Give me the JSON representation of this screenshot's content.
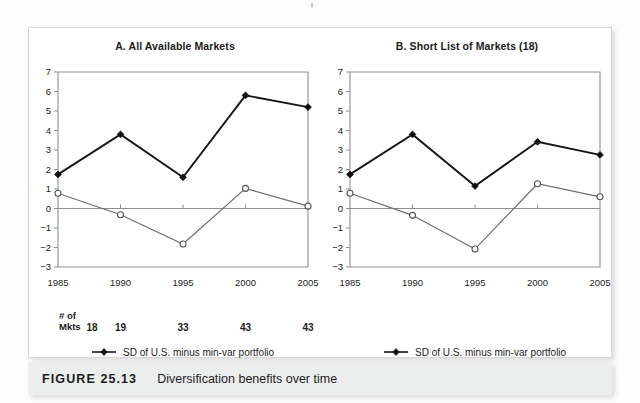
{
  "figure": {
    "caption_label": "FIGURE 25.13",
    "caption_text": "Diversification benefits over time"
  },
  "panels": [
    {
      "id": "A",
      "title": "A. All Available Markets",
      "mkts_head_line1": "# of",
      "mkts_head_line2": "Mkts",
      "mkts_values": [
        "18",
        "19",
        "33",
        "43",
        "43"
      ],
      "legend": [
        {
          "symbol": "filled-diamond-line",
          "label": "SD of U.S. minus min-var portfolio"
        },
        {
          "symbol": "open-circle-line",
          "label": "SD of U.S. minus mkt-cap portfolio"
        }
      ]
    },
    {
      "id": "B",
      "title": "B. Short List of Markets (18)",
      "legend": [
        {
          "symbol": "filled-diamond-line",
          "label": "SD of U.S. minus min-var portfolio"
        },
        {
          "symbol": "open-circle-line",
          "label": "SD of U.S. minus mkt-cap portfolio"
        }
      ]
    }
  ],
  "chart_data": [
    {
      "type": "line",
      "title": "A. All Available Markets",
      "xlabel": "",
      "ylabel": "",
      "x": [
        1985,
        1990,
        1995,
        2000,
        2005
      ],
      "xticklabels": [
        "1985",
        "1990",
        "1995",
        "2000",
        "2005"
      ],
      "yticks": [
        -3,
        -2,
        -1,
        0,
        1,
        2,
        3,
        4,
        5,
        6,
        7
      ],
      "yticklabels": [
        "−3",
        "−2",
        "−1",
        "0",
        "1",
        "2",
        "3",
        "4",
        "5",
        "6",
        "7"
      ],
      "ylim": [
        -3,
        7
      ],
      "xlim": [
        1985,
        2005
      ],
      "grid": false,
      "zero_line": true,
      "legend_position": "below",
      "series": [
        {
          "name": "SD of U.S. minus min-var portfolio",
          "marker": "filled-diamond",
          "color": "#161616",
          "values": [
            1.75,
            3.8,
            1.6,
            5.8,
            5.2
          ]
        },
        {
          "name": "SD of U.S. minus mkt-cap portfolio",
          "marker": "open-circle",
          "color": "#6e6e6e",
          "values": [
            0.78,
            -0.32,
            -1.82,
            1.03,
            0.12
          ]
        }
      ],
      "annotations": {
        "# of Mkts": [
          18,
          19,
          33,
          43,
          43
        ]
      }
    },
    {
      "type": "line",
      "title": "B. Short List of Markets (18)",
      "xlabel": "",
      "ylabel": "",
      "x": [
        1985,
        1990,
        1995,
        2000,
        2005
      ],
      "xticklabels": [
        "1985",
        "1990",
        "1995",
        "2000",
        "2005"
      ],
      "yticks": [
        -3,
        -2,
        -1,
        0,
        1,
        2,
        3,
        4,
        5,
        6,
        7
      ],
      "yticklabels": [
        "−3",
        "−2",
        "−1",
        "0",
        "1",
        "2",
        "3",
        "4",
        "5",
        "6",
        "7"
      ],
      "ylim": [
        -3,
        7
      ],
      "xlim": [
        1985,
        2005
      ],
      "grid": false,
      "zero_line": true,
      "legend_position": "below",
      "series": [
        {
          "name": "SD of U.S. minus min-var portfolio",
          "marker": "filled-diamond",
          "color": "#161616",
          "values": [
            1.75,
            3.8,
            1.15,
            3.42,
            2.75
          ]
        },
        {
          "name": "SD of U.S. minus mkt-cap portfolio",
          "marker": "open-circle",
          "color": "#6e6e6e",
          "values": [
            0.78,
            -0.35,
            -2.08,
            1.27,
            0.6
          ]
        }
      ]
    }
  ],
  "colors": {
    "page_background": "#fdfdfd",
    "frame_border": "#d7d7d7",
    "caption_bar": "#eceded",
    "axis": "#8f8f8f",
    "series_filled": "#161616",
    "series_open": "#6e6e6e",
    "text": "#1c1c1c"
  }
}
